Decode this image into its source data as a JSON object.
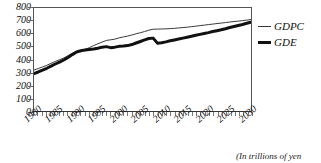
{
  "chart_data": {
    "type": "line",
    "title": "",
    "xlabel": "",
    "ylabel": "",
    "caption": "(In trillions of yen",
    "xlim": [
      1980,
      2031
    ],
    "ylim": [
      0,
      800
    ],
    "grid": false,
    "legend_position": "right",
    "y_ticks": [
      800,
      700,
      600,
      500,
      400,
      300,
      200,
      100,
      0
    ],
    "x_ticks": [
      1980,
      1985,
      1990,
      1995,
      2000,
      2005,
      2010,
      2015,
      2020,
      2025,
      2030
    ],
    "x_minor_tick_step": 1,
    "x": [
      1980,
      1981,
      1982,
      1983,
      1984,
      1985,
      1986,
      1987,
      1988,
      1989,
      1990,
      1991,
      1992,
      1993,
      1994,
      1995,
      1996,
      1997,
      1998,
      1999,
      2000,
      2001,
      2002,
      2003,
      2004,
      2005,
      2006,
      2007,
      2008,
      2009,
      2010,
      2011,
      2012,
      2013,
      2014,
      2015,
      2016,
      2017,
      2018,
      2019,
      2020,
      2021,
      2022,
      2023,
      2024,
      2025,
      2026,
      2027,
      2028,
      2029,
      2030,
      2031
    ],
    "series": [
      {
        "name": "GDPC",
        "style": "thin",
        "color": "#3a3a3a",
        "width": 1,
        "values": [
          318,
          330,
          342,
          355,
          370,
          385,
          398,
          412,
          430,
          448,
          462,
          470,
          478,
          492,
          508,
          522,
          535,
          548,
          553,
          558,
          568,
          575,
          582,
          590,
          600,
          608,
          617,
          628,
          635,
          636,
          637,
          638,
          640,
          642,
          645,
          648,
          651,
          655,
          659,
          663,
          667,
          671,
          675,
          679,
          683,
          687,
          691,
          695,
          698,
          702,
          706,
          710
        ]
      },
      {
        "name": "GDE",
        "style": "thick",
        "color": "#111111",
        "width": 3,
        "values": [
          290,
          303,
          317,
          332,
          348,
          365,
          380,
          396,
          416,
          438,
          458,
          468,
          474,
          478,
          482,
          488,
          496,
          500,
          492,
          496,
          502,
          504,
          508,
          516,
          528,
          540,
          552,
          563,
          566,
          527,
          530,
          537,
          545,
          552,
          559,
          566,
          573,
          580,
          588,
          595,
          602,
          609,
          617,
          624,
          631,
          639,
          648,
          656,
          664,
          672,
          681,
          690
        ]
      }
    ]
  },
  "legend": {
    "items": [
      {
        "label": "GDPC"
      },
      {
        "label": "GDE"
      }
    ]
  },
  "axes": {
    "y_labels": [
      "800",
      "700",
      "600",
      "500",
      "400",
      "300",
      "200",
      "100",
      "0"
    ],
    "x_labels": [
      "1980",
      "1985",
      "1990",
      "1995",
      "2000",
      "2005",
      "2010",
      "2015",
      "2020",
      "2025",
      "2030"
    ]
  },
  "caption": {
    "text": "(In trillions of yen"
  }
}
